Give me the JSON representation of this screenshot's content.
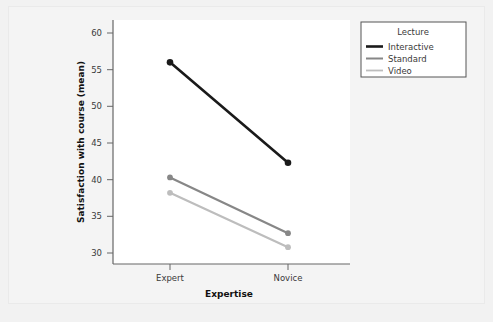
{
  "chart_data": {
    "type": "line",
    "title": "",
    "xlabel": "Expertise",
    "ylabel": "Satisfaction with course (mean)",
    "categories": [
      "Expert",
      "Novice"
    ],
    "xtick_labels": [
      "Expert",
      "Novice"
    ],
    "ytick_labels": [
      "30",
      "35",
      "40",
      "45",
      "50",
      "55",
      "60"
    ],
    "ytick_values": [
      30,
      35,
      40,
      45,
      50,
      55,
      60
    ],
    "ylim": [
      28.5,
      61.5
    ],
    "grid": false,
    "legend_position": "top-right",
    "legend_title": "Lecture",
    "markers": "circle",
    "series": [
      {
        "name": "Interactive",
        "values": [
          56.0,
          42.3
        ],
        "color": "#1a1a1a"
      },
      {
        "name": "Standard",
        "values": [
          40.3,
          32.7
        ],
        "color": "#878787"
      },
      {
        "name": "Video",
        "values": [
          38.2,
          30.8
        ],
        "color": "#bdbdbd"
      }
    ]
  },
  "axes": {
    "y_title": "Satisfaction with course (mean)",
    "x_title": "Expertise",
    "y_ticks": [
      {
        "label": "60",
        "value": 60
      },
      {
        "label": "55",
        "value": 55
      },
      {
        "label": "50",
        "value": 50
      },
      {
        "label": "45",
        "value": 45
      },
      {
        "label": "40",
        "value": 40
      },
      {
        "label": "35",
        "value": 35
      },
      {
        "label": "30",
        "value": 30
      }
    ],
    "x_ticks": [
      {
        "label": "Expert"
      },
      {
        "label": "Novice"
      }
    ]
  },
  "legend": {
    "title": "Lecture",
    "entries": [
      {
        "label": "Interactive",
        "color": "#1a1a1a",
        "width": 2.6
      },
      {
        "label": "Standard",
        "color": "#878787",
        "width": 2.0
      },
      {
        "label": "Video",
        "color": "#bdbdbd",
        "width": 1.6
      }
    ]
  },
  "colors": {
    "canvas_background": "#f2f2f2",
    "plot_background": "#ffffff",
    "axis_line": "#666666",
    "text": "#3a3a3a",
    "title_text": "#111111",
    "legend_border": "#555555"
  }
}
